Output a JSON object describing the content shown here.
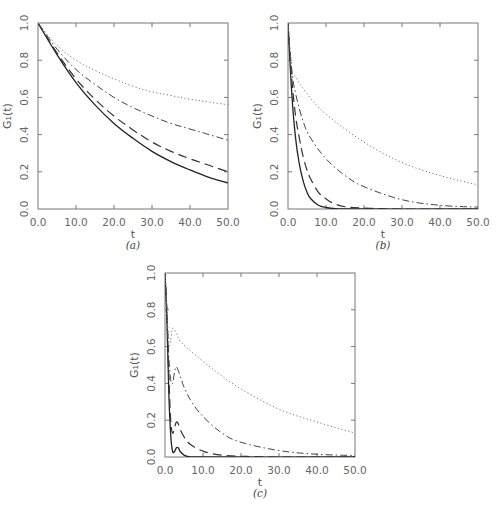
{
  "chart_data": [
    {
      "panel": "a",
      "type": "line",
      "caption": "(a)",
      "xlabel": "t",
      "ylabel": "G₁(t)",
      "xlim": [
        0,
        50
      ],
      "ylim": [
        0,
        1
      ],
      "xticks": [
        "0.0",
        "10.0",
        "20.0",
        "30.0",
        "40.0",
        "50.0"
      ],
      "yticks": [
        "0.0",
        "0.2",
        "0.4",
        "0.6",
        "0.8",
        "1.0"
      ],
      "grid": false,
      "series": [
        {
          "name": "solid",
          "style": "solid",
          "x": [
            0,
            5,
            10,
            15,
            20,
            25,
            30,
            35,
            40,
            45,
            50
          ],
          "y": [
            1.0,
            0.83,
            0.68,
            0.56,
            0.46,
            0.38,
            0.31,
            0.255,
            0.21,
            0.17,
            0.14
          ]
        },
        {
          "name": "dashed",
          "style": "dashed",
          "x": [
            0,
            5,
            10,
            15,
            20,
            25,
            30,
            35,
            40,
            45,
            50
          ],
          "y": [
            1.0,
            0.84,
            0.7,
            0.59,
            0.5,
            0.425,
            0.36,
            0.31,
            0.27,
            0.235,
            0.2
          ]
        },
        {
          "name": "dash-dot",
          "style": "dashdot",
          "x": [
            0,
            5,
            10,
            15,
            20,
            25,
            30,
            35,
            40,
            45,
            50
          ],
          "y": [
            1.0,
            0.86,
            0.75,
            0.67,
            0.6,
            0.545,
            0.5,
            0.46,
            0.43,
            0.4,
            0.37
          ]
        },
        {
          "name": "dotted",
          "style": "dotted",
          "x": [
            0,
            5,
            10,
            15,
            20,
            25,
            30,
            35,
            40,
            45,
            50
          ],
          "y": [
            1.0,
            0.88,
            0.8,
            0.745,
            0.7,
            0.66,
            0.63,
            0.61,
            0.59,
            0.575,
            0.56
          ]
        }
      ]
    },
    {
      "panel": "b",
      "type": "line",
      "caption": "(b)",
      "xlabel": "t",
      "ylabel": "G₁(t)",
      "xlim": [
        0,
        50
      ],
      "ylim": [
        0,
        1
      ],
      "xticks": [
        "0.0",
        "10.0",
        "20.0",
        "30.0",
        "40.0",
        "50.0"
      ],
      "yticks": [
        "0.0",
        "0.2",
        "0.4",
        "0.6",
        "0.8",
        "1.0"
      ],
      "grid": false,
      "series": [
        {
          "name": "solid",
          "style": "solid",
          "x": [
            0,
            1,
            2,
            3,
            4,
            5,
            6,
            8,
            10,
            12,
            15,
            50
          ],
          "y": [
            1.0,
            0.62,
            0.38,
            0.24,
            0.15,
            0.09,
            0.055,
            0.02,
            0.008,
            0.003,
            0.0,
            0.0
          ]
        },
        {
          "name": "dashed",
          "style": "dashed",
          "x": [
            0,
            1,
            2,
            3,
            4,
            5,
            6,
            8,
            10,
            12,
            15,
            20,
            30,
            50
          ],
          "y": [
            1.0,
            0.7,
            0.5,
            0.38,
            0.28,
            0.21,
            0.16,
            0.09,
            0.055,
            0.03,
            0.012,
            0.005,
            0.0,
            0.0
          ]
        },
        {
          "name": "dash-dot",
          "style": "dashdot",
          "x": [
            0,
            1,
            2,
            4,
            6,
            10,
            15,
            20,
            30,
            40,
            50
          ],
          "y": [
            1.0,
            0.75,
            0.62,
            0.47,
            0.38,
            0.27,
            0.18,
            0.12,
            0.05,
            0.02,
            0.01
          ]
        },
        {
          "name": "dotted",
          "style": "dotted",
          "x": [
            0,
            1,
            2,
            5,
            10,
            20,
            30,
            40,
            50
          ],
          "y": [
            1.0,
            0.75,
            0.71,
            0.62,
            0.51,
            0.36,
            0.25,
            0.18,
            0.13
          ]
        }
      ]
    },
    {
      "panel": "c",
      "type": "line",
      "caption": "(c)",
      "xlabel": "t",
      "ylabel": "G₁(t)",
      "xlim": [
        0,
        50
      ],
      "ylim": [
        0,
        1
      ],
      "xticks": [
        "0.0",
        "10.0",
        "20.0",
        "30.0",
        "40.0",
        "50.0"
      ],
      "yticks": [
        "0.0",
        "0.2",
        "0.4",
        "0.6",
        "0.8",
        "1.0"
      ],
      "grid": false,
      "series": [
        {
          "name": "solid",
          "style": "solid",
          "x": [
            0,
            0.5,
            1.0,
            1.5,
            2.0,
            2.5,
            3.0,
            3.5,
            4.0,
            5.0,
            6.0,
            8.0,
            50
          ],
          "y": [
            1.0,
            0.75,
            0.35,
            0.12,
            0.03,
            0.03,
            0.05,
            0.05,
            0.03,
            0.01,
            0.003,
            0.0,
            0.0
          ]
        },
        {
          "name": "dashed",
          "style": "dashed",
          "x": [
            0,
            0.5,
            1.0,
            1.5,
            2.0,
            2.5,
            3.0,
            3.5,
            4.0,
            5.0,
            6.0,
            8.0,
            10,
            12,
            15,
            20,
            30,
            50
          ],
          "y": [
            1.0,
            0.78,
            0.45,
            0.2,
            0.13,
            0.16,
            0.19,
            0.18,
            0.15,
            0.11,
            0.08,
            0.05,
            0.032,
            0.02,
            0.01,
            0.004,
            0.0,
            0.0
          ]
        },
        {
          "name": "dash-dot",
          "style": "dashdot",
          "x": [
            0,
            0.5,
            1.0,
            1.5,
            2.0,
            2.5,
            3.0,
            4.0,
            5.0,
            7.0,
            10,
            15,
            20,
            30,
            40,
            50
          ],
          "y": [
            1.0,
            0.8,
            0.55,
            0.42,
            0.4,
            0.46,
            0.49,
            0.44,
            0.38,
            0.3,
            0.22,
            0.13,
            0.08,
            0.035,
            0.015,
            0.008
          ]
        },
        {
          "name": "dotted",
          "style": "dotted",
          "x": [
            0,
            0.5,
            1.0,
            1.5,
            2.0,
            3.0,
            4.0,
            6.0,
            10,
            15,
            20,
            30,
            40,
            50
          ],
          "y": [
            1.0,
            0.8,
            0.62,
            0.63,
            0.7,
            0.67,
            0.63,
            0.59,
            0.52,
            0.44,
            0.37,
            0.26,
            0.19,
            0.13
          ]
        }
      ]
    }
  ]
}
